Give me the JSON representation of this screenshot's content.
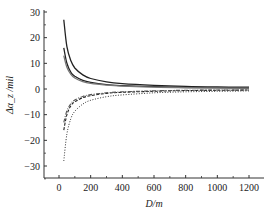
{
  "chart_data": {
    "type": "line",
    "title": "",
    "xlabel": "D/m",
    "ylabel": "Δα_z /mil",
    "xlim": [
      0,
      1250
    ],
    "ylim": [
      -35,
      30
    ],
    "xticks": [
      0,
      200,
      400,
      600,
      800,
      1000,
      1200
    ],
    "yticks": [
      -30,
      -20,
      -10,
      0,
      10,
      20,
      30
    ],
    "grid": false,
    "legend": null,
    "x": [
      30,
      50,
      75,
      100,
      150,
      200,
      300,
      400,
      600,
      800,
      1000,
      1200
    ],
    "series": [
      {
        "name": "solid upper 1",
        "style": "solid",
        "values": [
          27,
          16.5,
          11,
          8.2,
          5.5,
          4.1,
          2.8,
          2.1,
          1.4,
          1.0,
          0.8,
          0.7
        ]
      },
      {
        "name": "solid upper 2",
        "style": "solid",
        "values": [
          16,
          10,
          6.5,
          5.0,
          3.4,
          2.6,
          1.7,
          1.3,
          0.9,
          0.6,
          0.5,
          0.4
        ]
      },
      {
        "name": "gray upper 3",
        "style": "solid-gray",
        "values": [
          13,
          8.5,
          5.7,
          4.3,
          2.9,
          2.2,
          1.5,
          1.1,
          0.7,
          0.5,
          0.4,
          0.35
        ]
      },
      {
        "name": "dashed lower 1",
        "style": "dashed",
        "values": [
          -16,
          -10,
          -6.5,
          -5.0,
          -3.4,
          -2.6,
          -1.7,
          -1.3,
          -0.9,
          -0.6,
          -0.5,
          -0.4
        ]
      },
      {
        "name": "dash-dot lower 2",
        "style": "dashdot",
        "values": [
          -13,
          -8.5,
          -5.7,
          -4.3,
          -2.9,
          -2.2,
          -1.5,
          -1.1,
          -0.7,
          -0.5,
          -0.4,
          -0.35
        ]
      },
      {
        "name": "dotted lower 3",
        "style": "dotted",
        "values": [
          -28,
          -17.5,
          -11.5,
          -8.7,
          -5.9,
          -4.4,
          -3.0,
          -2.3,
          -1.5,
          -1.1,
          -0.9,
          -0.75
        ]
      }
    ]
  }
}
